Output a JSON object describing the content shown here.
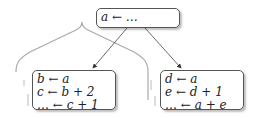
{
  "diagram": {
    "root": {
      "lines": [
        "a ← …"
      ]
    },
    "left": {
      "lines": [
        "b ← a",
        "c ← b + 2",
        "… ← c + 1"
      ]
    },
    "right": {
      "lines": [
        "d ← a",
        "e ← d + 1",
        "… ← a + e"
      ]
    }
  }
}
